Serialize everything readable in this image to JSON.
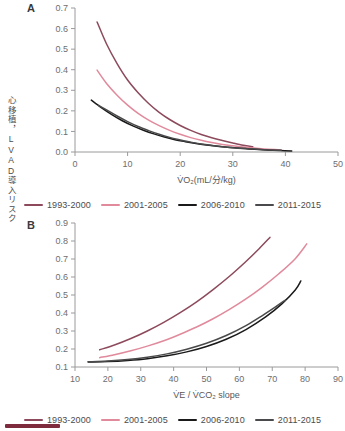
{
  "figure": {
    "y_axis_label": "心移植，LVAD導入リスク",
    "panel_a_letter": "A",
    "panel_b_letter": "B",
    "bottom_bar_color": "#7e2b3d"
  },
  "legend": {
    "items": [
      {
        "label": "1993-2000",
        "color": "#8c4a5c"
      },
      {
        "label": "2001-2005",
        "color": "#e08a9c"
      },
      {
        "label": "2006-2010",
        "color": "#1a1a1a"
      },
      {
        "label": "2011-2015",
        "color": "#4a4a4c"
      }
    ]
  },
  "chart_data": [
    {
      "type": "line",
      "panel": "A",
      "title": "A",
      "xlabel": "V̇O₂(mL/分/kg)",
      "ylabel": "心移植，LVAD導入リスク",
      "xlim": [
        0,
        50
      ],
      "ylim": [
        0.0,
        0.7
      ],
      "xticks": [
        0,
        10,
        20,
        30,
        40,
        50
      ],
      "yticks": [
        "0.0",
        "0.1",
        "0.2",
        "0.3",
        "0.4",
        "0.5",
        "0.6",
        "0.7"
      ],
      "grid": false,
      "legend_position": "below",
      "series": [
        {
          "name": "1993-2000",
          "color": "#8c4a5c",
          "x": [
            4.2,
            6,
            8,
            10,
            12,
            14,
            16,
            18,
            20,
            22,
            24,
            26,
            28,
            30,
            32,
            33.8
          ],
          "y": [
            0.632,
            0.525,
            0.43,
            0.35,
            0.288,
            0.236,
            0.193,
            0.158,
            0.129,
            0.105,
            0.085,
            0.069,
            0.056,
            0.044,
            0.033,
            0.026
          ]
        },
        {
          "name": "2001-2005",
          "color": "#e08a9c",
          "x": [
            4.2,
            6,
            8,
            10,
            12,
            14,
            16,
            18,
            20,
            22,
            24,
            26,
            28,
            30,
            32,
            34,
            36,
            38,
            39.2
          ],
          "y": [
            0.398,
            0.333,
            0.276,
            0.228,
            0.188,
            0.155,
            0.128,
            0.105,
            0.086,
            0.07,
            0.057,
            0.046,
            0.037,
            0.03,
            0.024,
            0.019,
            0.015,
            0.012,
            0.01
          ]
        },
        {
          "name": "2006-2010",
          "color": "#1a1a1a",
          "x": [
            3.1,
            5,
            7,
            9,
            11,
            13,
            15,
            17,
            19,
            21,
            23,
            25,
            27,
            29,
            31,
            33,
            35,
            37,
            39,
            41.2
          ],
          "y": [
            0.252,
            0.216,
            0.182,
            0.152,
            0.127,
            0.106,
            0.088,
            0.073,
            0.06,
            0.05,
            0.041,
            0.034,
            0.028,
            0.023,
            0.019,
            0.015,
            0.012,
            0.009,
            0.007,
            0.005
          ]
        },
        {
          "name": "2011-2015",
          "color": "#4a4a4c",
          "x": [
            4.5,
            6,
            8,
            10,
            12,
            14,
            16,
            18,
            20,
            22,
            24,
            26,
            28,
            30,
            32,
            34,
            36,
            38,
            39.2
          ],
          "y": [
            0.226,
            0.205,
            0.175,
            0.148,
            0.124,
            0.104,
            0.086,
            0.071,
            0.059,
            0.048,
            0.039,
            0.032,
            0.026,
            0.021,
            0.017,
            0.014,
            0.011,
            0.009,
            0.008
          ]
        }
      ]
    },
    {
      "type": "line",
      "panel": "B",
      "title": "B",
      "xlabel": "V̇E / V̇CO₂ slope",
      "ylabel": "心移植，LVAD導入リスク",
      "xlim": [
        10,
        90
      ],
      "ylim": [
        0.1,
        0.9
      ],
      "xticks": [
        10,
        20,
        30,
        40,
        50,
        60,
        70,
        80,
        90
      ],
      "yticks": [
        "0.1",
        "0.2",
        "0.3",
        "0.4",
        "0.5",
        "0.6",
        "0.7",
        "0.8",
        "0.9"
      ],
      "grid": false,
      "legend_position": "below",
      "series": [
        {
          "name": "1993-2000",
          "color": "#8c4a5c",
          "x": [
            17.5,
            22,
            27,
            32,
            37,
            42,
            47,
            52,
            57,
            62,
            66,
            69.3
          ],
          "y": [
            0.196,
            0.222,
            0.258,
            0.3,
            0.348,
            0.402,
            0.462,
            0.53,
            0.604,
            0.686,
            0.757,
            0.82
          ]
        },
        {
          "name": "2001-2005",
          "color": "#e08a9c",
          "x": [
            17.5,
            22,
            27,
            32,
            37,
            42,
            47,
            52,
            57,
            62,
            67,
            72,
            77,
            80.5
          ],
          "y": [
            0.152,
            0.168,
            0.19,
            0.216,
            0.246,
            0.282,
            0.322,
            0.368,
            0.42,
            0.478,
            0.544,
            0.618,
            0.702,
            0.784
          ]
        },
        {
          "name": "2006-2010",
          "color": "#1a1a1a",
          "x": [
            14,
            20,
            26,
            32,
            38,
            44,
            50,
            56,
            62,
            68,
            73,
            77,
            78.7
          ],
          "y": [
            0.128,
            0.13,
            0.136,
            0.146,
            0.162,
            0.184,
            0.214,
            0.254,
            0.308,
            0.378,
            0.452,
            0.528,
            0.578
          ]
        },
        {
          "name": "2011-2015",
          "color": "#4a4a4c",
          "x": [
            14,
            20,
            26,
            32,
            38,
            44,
            50,
            56,
            62,
            67,
            71,
            74
          ],
          "y": [
            0.129,
            0.133,
            0.141,
            0.154,
            0.173,
            0.199,
            0.232,
            0.275,
            0.33,
            0.386,
            0.434,
            0.472
          ]
        }
      ]
    }
  ]
}
